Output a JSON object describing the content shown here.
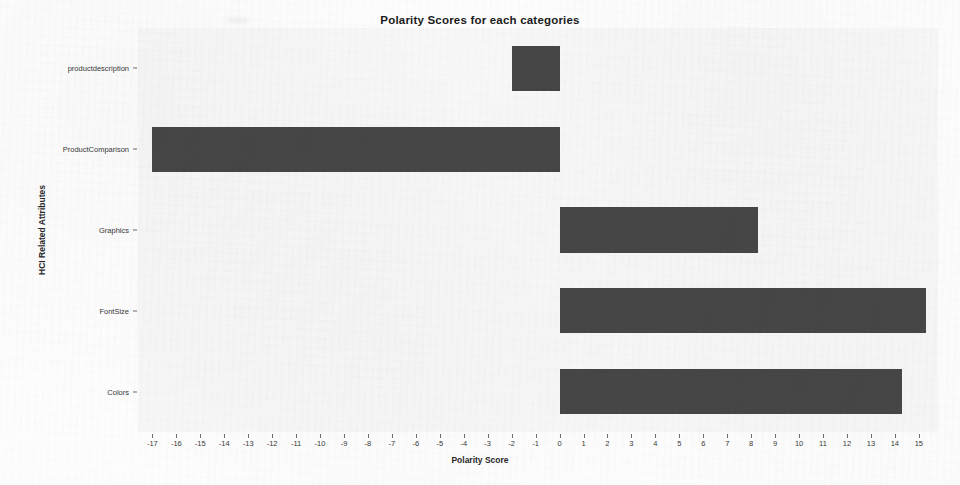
{
  "chart_data": {
    "type": "bar",
    "orientation": "horizontal",
    "title": "Polarity Scores for each categories",
    "xlabel": "Polarity Score",
    "ylabel": "HCI Related Attributes",
    "categories": [
      "productdescription",
      "ProductComparison",
      "Graphics",
      "FontSize",
      "Colors"
    ],
    "values": [
      -2,
      -17,
      8.3,
      15.3,
      14.3
    ],
    "xlim": [
      -17.6,
      15.8
    ],
    "xticks": [
      -17,
      -16,
      -15,
      -14,
      -13,
      -12,
      -11,
      -10,
      -9,
      -8,
      -7,
      -6,
      -5,
      -4,
      -3,
      -2,
      -1,
      0,
      1,
      2,
      3,
      4,
      5,
      6,
      7,
      8,
      9,
      10,
      11,
      12,
      13,
      14,
      15
    ],
    "xtick_labels": [
      "-17",
      "-16",
      "-15",
      "-14",
      "-13",
      "-12",
      "-11",
      "-10",
      "-9",
      "-8",
      "-7",
      "-6",
      "-5",
      "-4",
      "-3",
      "-2",
      "-1",
      "0",
      "1",
      "2",
      "3",
      "4",
      "5",
      "6",
      "7",
      "8",
      "9",
      "10",
      "11",
      "12",
      "13",
      "14",
      "15"
    ],
    "grid": false,
    "legend": false,
    "bar_color": "#474747",
    "plot_background": "#f6f6f6",
    "figure_background": "#fdfdfd"
  }
}
